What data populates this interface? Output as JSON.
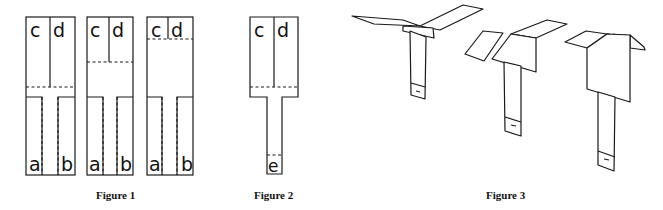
{
  "figures": [
    {
      "id": "figure-1",
      "caption": "Figure 1",
      "panels": [
        {
          "labels": {
            "top_left": "c",
            "top_right": "d",
            "bottom_left": "a",
            "bottom_right": "b"
          },
          "fold_line": "low"
        },
        {
          "labels": {
            "top_left": "c",
            "top_right": "d",
            "bottom_left": "a",
            "bottom_right": "b"
          },
          "fold_line": "middle"
        },
        {
          "labels": {
            "top_left": "c",
            "top_right": "d",
            "bottom_left": "a",
            "bottom_right": "b"
          },
          "fold_line": "high"
        }
      ]
    },
    {
      "id": "figure-2",
      "caption": "Figure 2",
      "labels": {
        "top_left": "c",
        "top_right": "d",
        "bottom": "e"
      }
    },
    {
      "id": "figure-3",
      "caption": "Figure 3",
      "items": [
        "helicopter-short-wings-spread",
        "helicopter-medium-wings",
        "helicopter-long-body"
      ]
    }
  ],
  "colors": {
    "line": "#1a1a1a",
    "background": "#ffffff"
  }
}
